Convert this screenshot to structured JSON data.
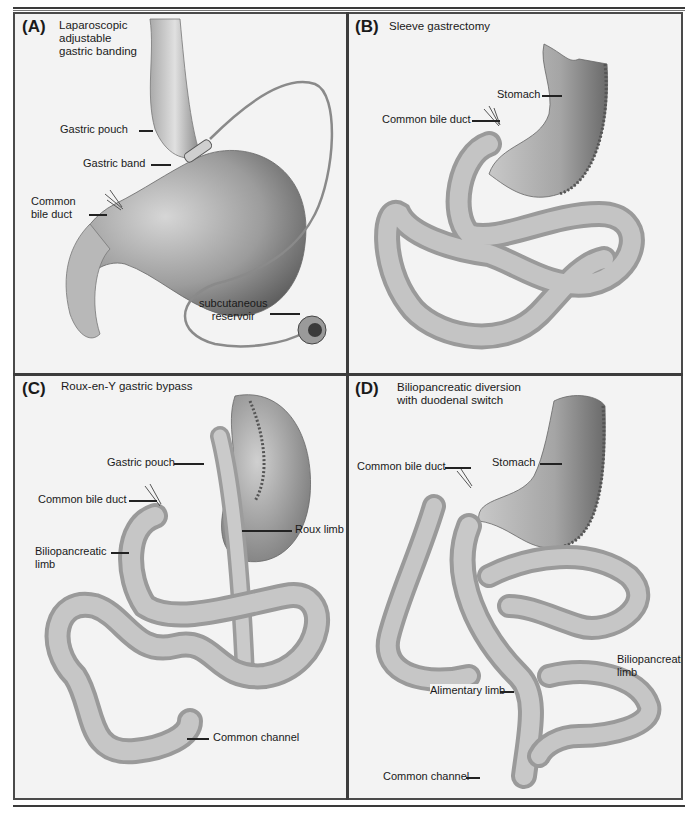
{
  "figure": {
    "panels": [
      {
        "id": "A",
        "letter": "(A)",
        "title_lines": [
          "Laparoscopic",
          "adjustable",
          "gastric banding"
        ],
        "labels": [
          {
            "text": "Gastric pouch"
          },
          {
            "text": "Gastric band"
          },
          {
            "text_lines": [
              "Common",
              "bile duct"
            ]
          },
          {
            "text_lines": [
              "subcutaneous",
              "reservoir"
            ]
          }
        ]
      },
      {
        "id": "B",
        "letter": "(B)",
        "title_lines": [
          "Sleeve gastrectomy"
        ],
        "labels": [
          {
            "text": "Stomach"
          },
          {
            "text": "Common bile duct"
          }
        ]
      },
      {
        "id": "C",
        "letter": "(C)",
        "title_lines": [
          "Roux-en-Y gastric bypass"
        ],
        "labels": [
          {
            "text": "Gastric pouch"
          },
          {
            "text": "Common bile duct"
          },
          {
            "text": "Roux limb"
          },
          {
            "text_lines": [
              "Biliopancreatic",
              "limb"
            ]
          },
          {
            "text": "Common channel"
          }
        ]
      },
      {
        "id": "D",
        "letter": "(D)",
        "title_lines": [
          "Biliopancreatic diversion",
          "with duodenal switch"
        ],
        "labels": [
          {
            "text": "Common bile duct"
          },
          {
            "text": "Stomach"
          },
          {
            "text_lines": [
              "Biliopancreatic",
              "limb"
            ]
          },
          {
            "text": "Alimentary limb"
          },
          {
            "text": "Common channel"
          }
        ]
      }
    ],
    "colors": {
      "frame": "#3c3c3c",
      "panel_bg": "#f3f3f3",
      "organ_fill": "#bdbdbd",
      "organ_shadow": "#8a8a8a",
      "staple": "#555555"
    }
  }
}
